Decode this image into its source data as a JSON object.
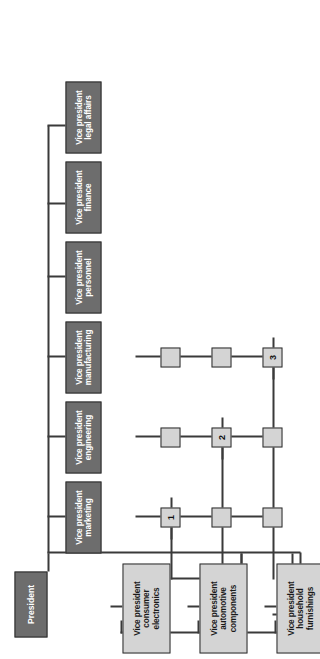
{
  "diagram": {
    "type": "org-chart-matrix",
    "orientation": "rotated-90-ccw",
    "colors": {
      "executive_box_fill": "#6d6d6d",
      "executive_box_text": "#ffffff",
      "product_box_fill": "#d4d4d4",
      "product_box_text": "#1a1a1a",
      "intersection_fill": "#d4d4d4",
      "line": "#3a3a3a",
      "border": "#2b2b2b",
      "background": "#ffffff"
    }
  },
  "root": {
    "label": "President"
  },
  "functional_vps": [
    {
      "id": "marketing",
      "line1": "Vice president",
      "line2": "marketing"
    },
    {
      "id": "engineering",
      "line1": "Vice president",
      "line2": "engineering"
    },
    {
      "id": "manufacturing",
      "line1": "Vice president",
      "line2": "manufacturing"
    },
    {
      "id": "personnel",
      "line1": "Vice president",
      "line2": "personnel"
    },
    {
      "id": "finance",
      "line1": "Vice president",
      "line2": "finance"
    },
    {
      "id": "legal-affairs",
      "line1": "Vice president",
      "line2": "legal affairs"
    }
  ],
  "product_vps": [
    {
      "id": "consumer-electronics",
      "line1": "Vice president",
      "line2": "consumer",
      "line3": "electronics"
    },
    {
      "id": "automotive-components",
      "line1": "Vice president",
      "line2": "automotive",
      "line3": "components"
    },
    {
      "id": "household-furnishings",
      "line1": "Vice president",
      "line2": "household",
      "line3": "furnishings"
    }
  ],
  "intersections": {
    "rows": [
      "consumer-electronics",
      "automotive-components",
      "household-furnishings"
    ],
    "columns": [
      "marketing",
      "engineering",
      "manufacturing"
    ],
    "cells": [
      [
        {
          "label": "1"
        },
        {
          "label": ""
        },
        {
          "label": ""
        }
      ],
      [
        {
          "label": ""
        },
        {
          "label": "2"
        },
        {
          "label": ""
        }
      ],
      [
        {
          "label": ""
        },
        {
          "label": ""
        },
        {
          "label": "3"
        }
      ]
    ]
  }
}
